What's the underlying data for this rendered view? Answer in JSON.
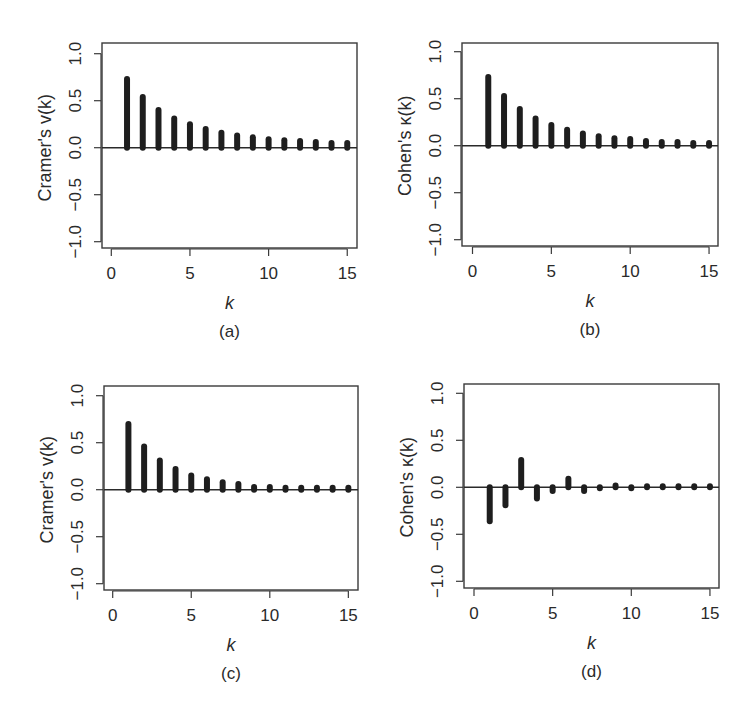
{
  "figure": {
    "panel_count": 4
  },
  "panels": [
    {
      "id": "a",
      "caption": "(a)",
      "ylabel": "Cramer's v(k)",
      "xlabel": "k",
      "x_ticks": [
        "0",
        "5",
        "10",
        "15"
      ],
      "y_ticks": [
        "−1.0",
        "−0.5",
        "0.0",
        "0.5",
        "1.0"
      ],
      "geom": {
        "left": 102,
        "right": 357,
        "top": 43,
        "bottom": 248,
        "x0": 111.3,
        "xunit": 15.73,
        "y0": 147.7,
        "yunit": 94
      }
    },
    {
      "id": "b",
      "caption": "(b)",
      "ylabel": "Cohen's κ(k)",
      "xlabel": "k",
      "x_ticks": [
        "0",
        "5",
        "10",
        "15"
      ],
      "y_ticks": [
        "−1.0",
        "−0.5",
        "0.0",
        "0.5",
        "1.0"
      ],
      "geom": {
        "left": 462,
        "right": 718,
        "top": 43,
        "bottom": 246,
        "x0": 472.5,
        "xunit": 15.77,
        "y0": 145.7,
        "yunit": 94
      }
    },
    {
      "id": "c",
      "caption": "(c)",
      "ylabel": "Cramer's v(k)",
      "xlabel": "k",
      "x_ticks": [
        "0",
        "5",
        "10",
        "15"
      ],
      "y_ticks": [
        "−1.0",
        "−0.5",
        "0.0",
        "0.5",
        "1.0"
      ],
      "geom": {
        "left": 104,
        "right": 358,
        "top": 386,
        "bottom": 590,
        "x0": 112.7,
        "xunit": 15.71,
        "y0": 489.7,
        "yunit": 94
      }
    },
    {
      "id": "d",
      "caption": "(d)",
      "ylabel": "Cohen's κ(k)",
      "xlabel": "k",
      "x_ticks": [
        "0",
        "5",
        "10",
        "15"
      ],
      "y_ticks": [
        "−1.0",
        "−0.5",
        "0.0",
        "0.5",
        "1.0"
      ],
      "geom": {
        "left": 464,
        "right": 719,
        "top": 384,
        "bottom": 588,
        "x0": 474,
        "xunit": 15.73,
        "y0": 487.3,
        "yunit": 94
      }
    }
  ],
  "chart_data": [
    {
      "type": "bar",
      "subtype": "stem / autocorrelation-style lag plot",
      "panel": "(a)",
      "title": "",
      "xlabel": "k",
      "ylabel": "Cramer's v(k)",
      "x": [
        1,
        2,
        3,
        4,
        5,
        6,
        7,
        8,
        9,
        10,
        11,
        12,
        13,
        14,
        15
      ],
      "values": [
        0.73,
        0.54,
        0.4,
        0.31,
        0.25,
        0.2,
        0.16,
        0.13,
        0.11,
        0.09,
        0.08,
        0.07,
        0.06,
        0.05,
        0.05
      ],
      "xlim": [
        0,
        15
      ],
      "ylim": [
        -1.0,
        1.0
      ],
      "x_ticks": [
        0,
        5,
        10,
        15
      ],
      "y_ticks": [
        -1.0,
        -0.5,
        0.0,
        0.5,
        1.0
      ],
      "grid": false,
      "legend": null
    },
    {
      "type": "bar",
      "subtype": "stem / autocorrelation-style lag plot",
      "panel": "(b)",
      "title": "",
      "xlabel": "k",
      "ylabel": "Cohen's κ(k)",
      "x": [
        1,
        2,
        3,
        4,
        5,
        6,
        7,
        8,
        9,
        10,
        11,
        12,
        13,
        14,
        15
      ],
      "values": [
        0.73,
        0.53,
        0.39,
        0.29,
        0.22,
        0.17,
        0.13,
        0.1,
        0.08,
        0.07,
        0.05,
        0.04,
        0.04,
        0.03,
        0.03
      ],
      "xlim": [
        0,
        15
      ],
      "ylim": [
        -1.0,
        1.0
      ],
      "x_ticks": [
        0,
        5,
        10,
        15
      ],
      "y_ticks": [
        -1.0,
        -0.5,
        0.0,
        0.5,
        1.0
      ],
      "grid": false,
      "legend": null
    },
    {
      "type": "bar",
      "subtype": "stem / autocorrelation-style lag plot",
      "panel": "(c)",
      "title": "",
      "xlabel": "k",
      "ylabel": "Cramer's v(k)",
      "x": [
        1,
        2,
        3,
        4,
        5,
        6,
        7,
        8,
        9,
        10,
        11,
        12,
        13,
        14,
        15
      ],
      "values": [
        0.7,
        0.46,
        0.31,
        0.22,
        0.15,
        0.11,
        0.08,
        0.06,
        0.03,
        0.03,
        0.02,
        0.02,
        0.02,
        0.02,
        0.02
      ],
      "xlim": [
        0,
        15
      ],
      "ylim": [
        -1.0,
        1.0
      ],
      "x_ticks": [
        0,
        5,
        10,
        15
      ],
      "y_ticks": [
        -1.0,
        -0.5,
        0.0,
        0.5,
        1.0
      ],
      "grid": false,
      "legend": null
    },
    {
      "type": "bar",
      "subtype": "stem / autocorrelation-style lag plot",
      "panel": "(d)",
      "title": "",
      "xlabel": "k",
      "ylabel": "Cohen's κ(k)",
      "x": [
        1,
        2,
        3,
        4,
        5,
        6,
        7,
        8,
        9,
        10,
        11,
        12,
        13,
        14,
        15
      ],
      "values": [
        -0.36,
        -0.19,
        0.29,
        -0.12,
        -0.04,
        0.09,
        -0.04,
        -0.01,
        0.02,
        -0.01,
        0.01,
        0.01,
        0.01,
        0.01,
        0.01
      ],
      "xlim": [
        0,
        15
      ],
      "ylim": [
        -1.0,
        1.0
      ],
      "x_ticks": [
        0,
        5,
        10,
        15
      ],
      "y_ticks": [
        -1.0,
        -0.5,
        0.0,
        0.5,
        1.0
      ],
      "grid": false,
      "legend": null
    }
  ]
}
